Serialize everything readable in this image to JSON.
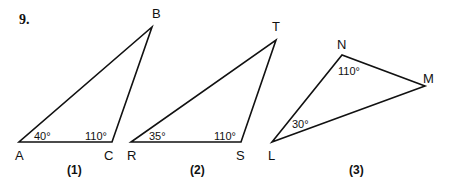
{
  "problem_number": "9.",
  "triangles": [
    {
      "caption": "(1)",
      "vertices": {
        "a": "A",
        "b": "C",
        "c": "B"
      },
      "angles": {
        "a": "40°",
        "b": "110°"
      }
    },
    {
      "caption": "(2)",
      "vertices": {
        "a": "R",
        "b": "S",
        "c": "T"
      },
      "angles": {
        "a": "35°",
        "b": "110°"
      }
    },
    {
      "caption": "(3)",
      "vertices": {
        "a": "L",
        "b": "N",
        "c": "M"
      },
      "angles": {
        "a": "30°",
        "b": "110°"
      }
    }
  ]
}
